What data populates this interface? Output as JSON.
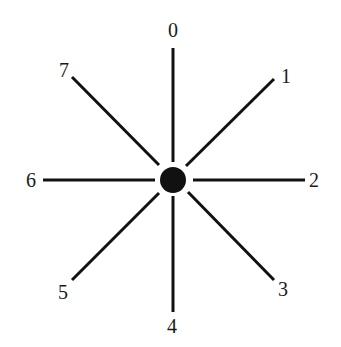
{
  "diagram": {
    "type": "radial-directions",
    "center": {
      "x": 173,
      "y": 180,
      "radius": 13
    },
    "colors": {
      "line": "#111111",
      "dot": "#111111",
      "text": "#1a1a1a",
      "background": "#ffffff"
    },
    "spokes": [
      {
        "label": "0",
        "direction": "up",
        "x1": 173,
        "y1": 48,
        "x2": 173,
        "y2": 162,
        "lx": 173,
        "ly": 37
      },
      {
        "label": "1",
        "direction": "up-right",
        "x1": 186,
        "y1": 166,
        "x2": 274,
        "y2": 79,
        "lx": 286,
        "ly": 83
      },
      {
        "label": "2",
        "direction": "right",
        "x1": 193,
        "y1": 180,
        "x2": 305,
        "y2": 180,
        "lx": 314,
        "ly": 187
      },
      {
        "label": "3",
        "direction": "down-right",
        "x1": 188,
        "y1": 192,
        "x2": 274,
        "y2": 280,
        "lx": 283,
        "ly": 296
      },
      {
        "label": "4",
        "direction": "down",
        "x1": 173,
        "y1": 196,
        "x2": 173,
        "y2": 312,
        "lx": 172,
        "ly": 333
      },
      {
        "label": "5",
        "direction": "down-left",
        "x1": 159,
        "y1": 193,
        "x2": 72,
        "y2": 280,
        "lx": 63,
        "ly": 299
      },
      {
        "label": "6",
        "direction": "left",
        "x1": 43,
        "y1": 180,
        "x2": 155,
        "y2": 180,
        "lx": 31,
        "ly": 187
      },
      {
        "label": "7",
        "direction": "up-left",
        "x1": 72,
        "y1": 77,
        "x2": 159,
        "y2": 165,
        "lx": 64,
        "ly": 77
      }
    ]
  }
}
